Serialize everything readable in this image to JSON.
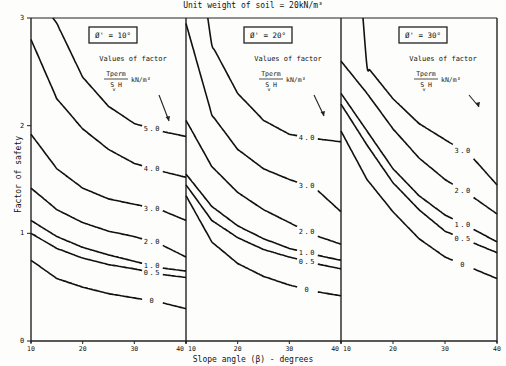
{
  "chart_data": {
    "type": "line",
    "title": "Unit weight of soil = 20kN/m³",
    "xlabel": "Slope angle (β) - degrees",
    "ylabel": "Factor of safety",
    "ylim": [
      0,
      3
    ],
    "yticks": [
      "0",
      "1",
      "2",
      "3"
    ],
    "xticks": [
      "10",
      "20",
      "30",
      "40"
    ],
    "grid": false,
    "legend_note": {
      "heading": "Values of factor",
      "numerator": "T perm",
      "denominator": "S v H",
      "unit": "kN/m³"
    },
    "x": [
      10,
      15,
      20,
      25,
      30,
      35,
      40
    ],
    "panels": [
      {
        "label": "Ø' = 10°",
        "series": [
          {
            "name": "5.0",
            "values": [
              null,
              2.95,
              2.45,
              2.18,
              2.02,
              1.95,
              1.9
            ]
          },
          {
            "name": "4.0",
            "values": [
              2.8,
              2.25,
              1.97,
              1.78,
              1.65,
              1.58,
              1.52
            ]
          },
          {
            "name": "3.0",
            "values": [
              1.92,
              1.6,
              1.42,
              1.32,
              1.27,
              1.22,
              1.12
            ]
          },
          {
            "name": "2.0",
            "values": [
              1.42,
              1.22,
              1.1,
              1.02,
              0.97,
              0.9,
              0.78
            ]
          },
          {
            "name": "1.0",
            "values": [
              1.12,
              0.97,
              0.87,
              0.8,
              0.74,
              0.68,
              0.65
            ]
          },
          {
            "name": "0.5",
            "values": [
              1.0,
              0.86,
              0.77,
              0.71,
              0.67,
              0.62,
              0.59
            ]
          },
          {
            "name": "0",
            "values": [
              0.75,
              0.58,
              0.5,
              0.44,
              0.4,
              0.36,
              0.3
            ]
          }
        ]
      },
      {
        "label": "Ø' = 20°",
        "series": [
          {
            "name": "4.0",
            "values": [
              null,
              2.75,
              2.3,
              2.05,
              1.92,
              1.88,
              1.85
            ]
          },
          {
            "name": "3.0",
            "values": [
              2.95,
              2.1,
              1.78,
              1.6,
              1.5,
              1.42,
              1.2
            ]
          },
          {
            "name": "2.0",
            "values": [
              2.05,
              1.62,
              1.38,
              1.22,
              1.1,
              0.98,
              0.9
            ]
          },
          {
            "name": "1.0",
            "values": [
              1.55,
              1.25,
              1.07,
              0.95,
              0.86,
              0.8,
              0.75
            ]
          },
          {
            "name": "0.5",
            "values": [
              1.45,
              1.12,
              0.96,
              0.85,
              0.78,
              0.72,
              0.67
            ]
          },
          {
            "name": "0",
            "values": [
              1.35,
              0.92,
              0.72,
              0.6,
              0.52,
              0.46,
              0.42
            ]
          }
        ]
      },
      {
        "label": "Ø' = 30°",
        "series": [
          {
            "name": "3.0",
            "values": [
              null,
              2.55,
              2.25,
              2.02,
              1.87,
              1.72,
              1.45
            ]
          },
          {
            "name": "2.0",
            "values": [
              2.6,
              2.3,
              1.97,
              1.7,
              1.5,
              1.35,
              1.18
            ]
          },
          {
            "name": "1.0",
            "values": [
              2.3,
              1.95,
              1.6,
              1.35,
              1.17,
              1.05,
              0.92
            ]
          },
          {
            "name": "0.5",
            "values": [
              2.2,
              1.82,
              1.47,
              1.22,
              1.02,
              0.92,
              0.82
            ]
          },
          {
            "name": "0",
            "values": [
              1.95,
              1.5,
              1.2,
              0.95,
              0.78,
              0.68,
              0.58
            ]
          }
        ]
      }
    ]
  }
}
